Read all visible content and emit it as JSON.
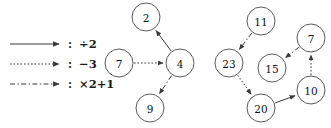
{
  "figure": {
    "width": 331,
    "height": 128,
    "background": "#ffffff",
    "stroke_color": "#3a3a3a",
    "node_stroke": "#4a4a4a",
    "node_fill": "#ffffff",
    "text_color": "#111111"
  },
  "legend": {
    "separator": ":",
    "entries": [
      {
        "id": "legend-divide",
        "style": "solid",
        "label": "÷2",
        "name": "divide-by-two"
      },
      {
        "id": "legend-minus",
        "style": "dotted",
        "label": "−3",
        "name": "minus-three"
      },
      {
        "id": "legend-double",
        "style": "dashdot",
        "label": "×2+1",
        "name": "double-plus-one"
      }
    ]
  },
  "graphs": [
    {
      "id": "graph-left",
      "nodes": [
        {
          "id": "L2",
          "label": "2",
          "cx": 146,
          "cy": 17,
          "r": 14
        },
        {
          "id": "L7",
          "label": "7",
          "cx": 119,
          "cy": 63,
          "r": 14
        },
        {
          "id": "L4",
          "label": "4",
          "cx": 180,
          "cy": 63,
          "r": 14
        },
        {
          "id": "L9",
          "label": "9",
          "cx": 150,
          "cy": 108,
          "r": 14
        }
      ],
      "edges": [
        {
          "id": "L4-L2",
          "from": "L4",
          "to": "L2",
          "style": "solid",
          "op": "÷2"
        },
        {
          "id": "L7-L4",
          "from": "L7",
          "to": "L4",
          "style": "dotted",
          "op": "−3"
        },
        {
          "id": "L4-L9",
          "from": "L4",
          "to": "L9",
          "style": "dashdot",
          "op": "×2+1"
        }
      ]
    },
    {
      "id": "graph-right",
      "nodes": [
        {
          "id": "R11",
          "label": "11",
          "cx": 261,
          "cy": 21,
          "r": 14
        },
        {
          "id": "R7",
          "label": "7",
          "cx": 311,
          "cy": 38,
          "r": 14
        },
        {
          "id": "R23",
          "label": "23",
          "cx": 229,
          "cy": 63,
          "r": 14
        },
        {
          "id": "R15",
          "label": "15",
          "cx": 272,
          "cy": 68,
          "r": 14
        },
        {
          "id": "R10",
          "label": "10",
          "cx": 311,
          "cy": 90,
          "r": 14
        },
        {
          "id": "R20",
          "label": "20",
          "cx": 261,
          "cy": 108,
          "r": 14
        }
      ],
      "edges": [
        {
          "id": "R11-R23",
          "from": "R11",
          "to": "R23",
          "style": "dashdot",
          "op": "×2+1"
        },
        {
          "id": "R7-R15",
          "from": "R7",
          "to": "R15",
          "style": "dashdot",
          "op": "×2+1"
        },
        {
          "id": "R10-R7",
          "from": "R10",
          "to": "R7",
          "style": "dotted",
          "op": "−3"
        },
        {
          "id": "R23-R20",
          "from": "R23",
          "to": "R20",
          "style": "dotted",
          "op": "−3"
        },
        {
          "id": "R20-R10",
          "from": "R20",
          "to": "R10",
          "style": "solid",
          "op": "÷2"
        }
      ]
    }
  ]
}
